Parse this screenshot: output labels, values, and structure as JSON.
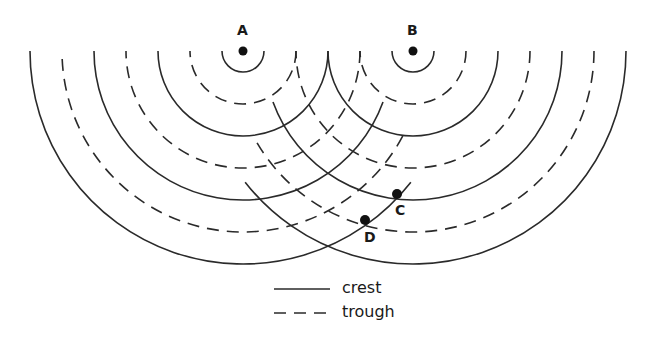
{
  "sources": [
    {
      "label": "A",
      "cx": 243,
      "cy": 51
    },
    {
      "label": "B",
      "cx": 413,
      "cy": 51
    }
  ],
  "radii": [
    21,
    53,
    85,
    117,
    149,
    181,
    213
  ],
  "wave_types": [
    "crest",
    "trough",
    "crest",
    "trough",
    "crest",
    "trough",
    "crest"
  ],
  "points": [
    {
      "label": "C",
      "x": 397,
      "y": 194,
      "label_x": 395,
      "label_y": 202
    },
    {
      "label": "D",
      "x": 365,
      "y": 220,
      "label_x": 363,
      "label_y": 229
    }
  ],
  "legend": {
    "crest_label": "crest",
    "trough_label": "trough"
  },
  "colors": {
    "line": "#2a2a2a"
  }
}
